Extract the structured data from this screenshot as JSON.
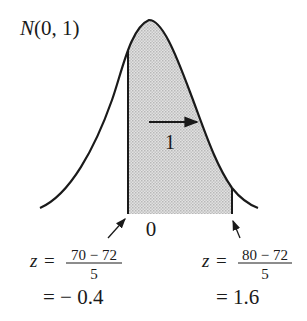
{
  "diagram": {
    "title_prefix": "N",
    "title_args": "(0, 1)",
    "arrow_label": "1",
    "center_tick": "0",
    "left_bound": {
      "var": "z",
      "eq": "=",
      "numerator": "70 − 72",
      "denominator": "5",
      "result": "= − 0.4",
      "value": -0.4
    },
    "right_bound": {
      "var": "z",
      "eq": "=",
      "numerator": "80 − 72",
      "denominator": "5",
      "result": "= 1.6",
      "value": 1.6
    },
    "colors": {
      "ink": "#1a1a1a",
      "shade": "#d4d4d4",
      "background": "#ffffff"
    }
  }
}
